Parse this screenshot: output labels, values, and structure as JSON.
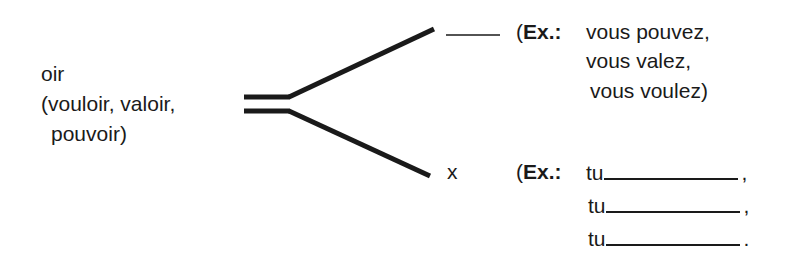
{
  "left": {
    "ending": "oir",
    "examples_line1": "(vouloir, valoir,",
    "examples_line2": "pouvoir)"
  },
  "upper_branch": {
    "ending_blank": "",
    "ex_label": "Ex.:",
    "open_paren": "(",
    "examples": [
      "vous pouvez,",
      "vous valez,",
      "vous voulez)"
    ]
  },
  "lower_branch": {
    "ending": "x",
    "ex_label": "Ex.:",
    "open_paren": "(",
    "rows": [
      {
        "prefix": "tu",
        "value": "",
        "punct": ","
      },
      {
        "prefix": "tu",
        "value": "",
        "punct": ","
      },
      {
        "prefix": "tu",
        "value": "",
        "punct": "."
      }
    ]
  },
  "colors": {
    "ink": "#1a1a1a",
    "background": "#ffffff"
  }
}
